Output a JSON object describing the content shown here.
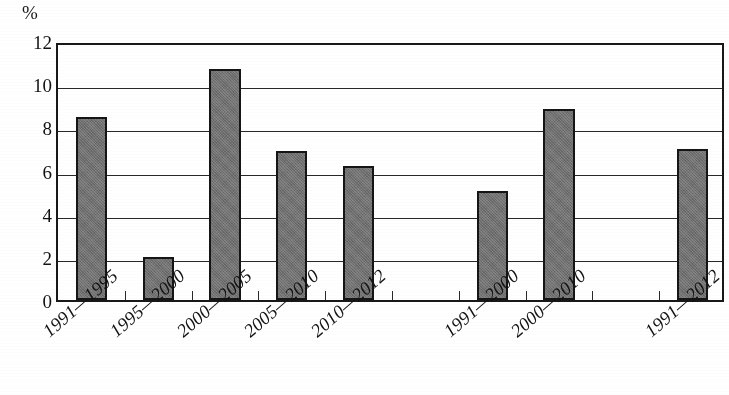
{
  "chart_data": {
    "type": "bar",
    "title": "",
    "subtitle": "",
    "xlabel": "",
    "ylabel": "%",
    "unit_label": "%",
    "ylim": [
      0,
      12
    ],
    "ytick_step": 2,
    "yticks": [
      12,
      10,
      8,
      6,
      4,
      2,
      0
    ],
    "ytick_labels": [
      "12",
      "10",
      "8",
      "6",
      "4",
      "2",
      "0"
    ],
    "grid": true,
    "grid_axis": "y",
    "legend": false,
    "legend_position": "none",
    "bar_color": "#6f6f6f",
    "bar_border_color": "#171717",
    "axis_color": "#1a1a1a",
    "background_color": "#ffffff",
    "categories": [
      "1991—1995",
      "1995—2000",
      "2000—2005",
      "2005—2010",
      "2010—2012",
      "1991—2000",
      "2000—2010",
      "1991—2012"
    ],
    "values": [
      8.5,
      2.0,
      10.7,
      6.9,
      6.2,
      5.05,
      8.85,
      7.0
    ],
    "value_labels": [
      "8.5",
      "2.0",
      "10.7",
      "6.9",
      "6.2",
      "5.0",
      "8.9",
      "7.0"
    ],
    "slot_count": 10,
    "bars": [
      {
        "label": "1991—1995",
        "value": 8.5,
        "slot": 0
      },
      {
        "label": "1995—2000",
        "value": 2.0,
        "slot": 1
      },
      {
        "label": "2000—2005",
        "value": 10.7,
        "slot": 2
      },
      {
        "label": "2005—2010",
        "value": 6.9,
        "slot": 3
      },
      {
        "label": "2010—2012",
        "value": 6.2,
        "slot": 4
      },
      {
        "label": "1991—2000",
        "value": 5.05,
        "slot": 6
      },
      {
        "label": "2000—2010",
        "value": 8.85,
        "slot": 7
      },
      {
        "label": "1991—2012",
        "value": 7.0,
        "slot": 9
      }
    ],
    "empty_slots": [
      5,
      8
    ]
  }
}
